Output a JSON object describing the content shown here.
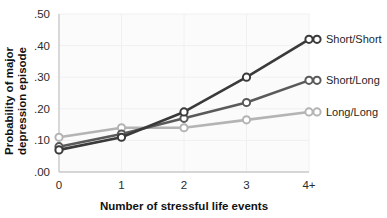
{
  "chart_data": {
    "type": "line",
    "title": "",
    "subtitle": "",
    "xlabel": "Number of stressful life events",
    "ylabel": "Probability of major depression episode",
    "ylabel_line1": "Probability of major",
    "ylabel_line2": "depression episode",
    "categories": [
      "0",
      "1",
      "2",
      "3",
      "4+"
    ],
    "xticklabels": [
      "0",
      "1",
      "2",
      "3",
      "4+"
    ],
    "yticklabels": [
      ".00",
      ".10",
      ".20",
      ".30",
      ".40",
      ".50"
    ],
    "yticks": [
      0.0,
      0.1,
      0.2,
      0.3,
      0.4,
      0.5
    ],
    "ylim": [
      0.0,
      0.5
    ],
    "xlim": [
      0,
      4
    ],
    "grid": "vertical-faint",
    "legend_position": "right-of-plot",
    "markers": "open-circle",
    "series": [
      {
        "name": "Short/Short",
        "label": "Short/Short",
        "color": "#3a3a3a",
        "values": [
          0.07,
          0.11,
          0.19,
          0.3,
          0.42
        ]
      },
      {
        "name": "Short/Long",
        "label": "Short/Long",
        "color": "#5a5a5a",
        "values": [
          0.08,
          0.12,
          0.17,
          0.22,
          0.29
        ]
      },
      {
        "name": "Long/Long",
        "label": "Long/Long",
        "color": "#b4b4b4",
        "values": [
          0.11,
          0.14,
          0.14,
          0.165,
          0.19
        ]
      }
    ]
  },
  "colors": {
    "background": "#ffffff",
    "plot_background": "#fbfbfb",
    "axis": "#c9c9c9",
    "gridline": "#f0f0f0",
    "text": "#1f1f1f",
    "series_short_short": "#3a3a3a",
    "series_short_long": "#5a5a5a",
    "series_long_long": "#b4b4b4",
    "marker_fill": "#ffffff"
  },
  "axes": {
    "y_axis_name": "y-axis",
    "x_axis_name": "x-axis"
  }
}
